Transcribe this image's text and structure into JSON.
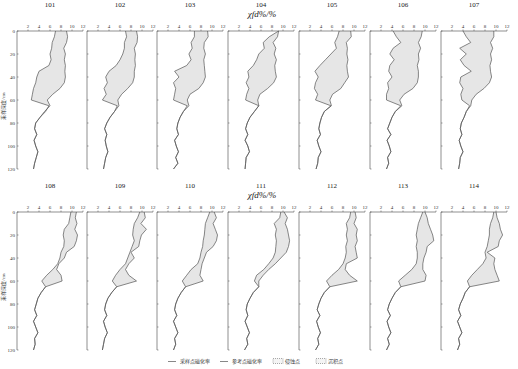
{
  "chart_data": {
    "type": "line",
    "title": "",
    "xlabel": "χfd%/%",
    "ylabel": "采样深度/cm",
    "xlim": [
      0,
      12
    ],
    "ylim": [
      0,
      120
    ],
    "y_inverted": true,
    "x_ticks": [
      2,
      4,
      6,
      8,
      10,
      12
    ],
    "y_ticks": [
      0,
      20,
      40,
      60,
      80,
      100,
      120
    ],
    "grid": false,
    "legend_position": "bottom",
    "legend": [
      {
        "key": "sample",
        "label": "采样点磁化率",
        "style": "solid-line"
      },
      {
        "key": "reference",
        "label": "参考点磁化率",
        "style": "solid-line"
      },
      {
        "key": "erosion",
        "label": "侵蚀点",
        "style": "dashed-box"
      },
      {
        "key": "deposition",
        "label": "沉积点",
        "style": "dashed-box"
      }
    ],
    "depth": [
      0,
      5,
      10,
      15,
      20,
      25,
      30,
      35,
      40,
      45,
      50,
      55,
      60,
      65,
      70,
      75,
      80,
      85,
      90,
      95,
      100,
      105,
      110,
      115,
      120
    ],
    "panels": [
      {
        "id": "101",
        "row": 0,
        "type": "erosion",
        "reference": [
          9.0,
          9.2,
          9.0,
          8.5,
          8.8,
          8.6,
          8.8,
          8.7,
          8.8,
          8.6,
          7.8,
          6.5,
          5.5,
          6.0,
          5.0,
          4.2,
          3.4,
          3.2,
          3.6,
          3.1,
          3.4,
          3.8,
          3.5,
          3.2,
          3.0
        ],
        "sample": [
          7.0,
          6.8,
          6.4,
          6.3,
          6.0,
          6.2,
          5.8,
          4.0,
          3.6,
          3.4,
          3.0,
          2.8,
          2.6,
          5.8,
          5.2,
          4.2,
          3.4,
          3.2,
          3.6,
          3.1,
          3.4,
          3.8,
          3.5,
          3.2,
          3.0
        ]
      },
      {
        "id": "102",
        "row": 0,
        "type": "erosion",
        "reference": [
          9.0,
          9.2,
          9.1,
          8.6,
          8.8,
          8.7,
          8.8,
          8.6,
          8.6,
          8.3,
          7.4,
          6.3,
          5.6,
          5.8,
          5.0,
          4.2,
          3.6,
          3.2,
          3.6,
          3.3,
          3.5,
          3.8,
          3.4,
          3.2,
          3.0
        ],
        "sample": [
          7.0,
          7.2,
          6.8,
          6.8,
          6.5,
          6.0,
          5.3,
          4.0,
          3.4,
          3.7,
          3.1,
          3.5,
          2.8,
          5.5,
          5.0,
          4.2,
          3.6,
          3.2,
          3.6,
          3.3,
          3.5,
          3.8,
          3.4,
          3.2,
          3.0
        ]
      },
      {
        "id": "103",
        "row": 0,
        "type": "erosion",
        "reference": [
          9.2,
          9.3,
          8.6,
          8.5,
          8.8,
          8.5,
          8.6,
          8.7,
          8.8,
          8.4,
          7.6,
          6.0,
          5.5,
          5.8,
          4.8,
          4.2,
          3.8,
          3.6,
          3.9,
          3.2,
          3.5,
          3.9,
          3.4,
          3.8,
          3.0
        ],
        "sample": [
          6.8,
          6.8,
          6.2,
          6.4,
          5.8,
          6.2,
          5.4,
          3.2,
          4.0,
          3.0,
          3.4,
          3.2,
          3.0,
          5.5,
          4.8,
          4.2,
          3.8,
          3.6,
          3.9,
          3.2,
          3.5,
          3.9,
          3.4,
          3.8,
          3.0
        ]
      },
      {
        "id": "104",
        "row": 0,
        "type": "erosion",
        "reference": [
          9.2,
          9.0,
          8.2,
          8.7,
          8.4,
          8.8,
          8.5,
          8.6,
          8.8,
          8.3,
          7.2,
          5.8,
          5.4,
          5.6,
          4.8,
          4.0,
          3.5,
          3.2,
          3.6,
          3.1,
          3.6,
          3.9,
          3.3,
          3.2,
          3.1
        ],
        "sample": [
          9.2,
          7.5,
          6.4,
          6.6,
          5.6,
          5.2,
          4.6,
          3.6,
          3.8,
          3.3,
          3.8,
          3.4,
          3.2,
          5.6,
          4.8,
          4.0,
          3.5,
          3.2,
          3.6,
          3.1,
          3.6,
          3.9,
          3.3,
          3.2,
          3.1
        ]
      },
      {
        "id": "105",
        "row": 0,
        "type": "erosion",
        "reference": [
          9.4,
          9.5,
          8.6,
          8.8,
          8.7,
          8.9,
          8.7,
          8.8,
          9.0,
          8.3,
          7.6,
          6.1,
          5.6,
          5.9,
          4.6,
          4.1,
          3.8,
          3.6,
          3.9,
          3.3,
          3.6,
          4.0,
          3.5,
          3.4,
          3.1
        ],
        "sample": [
          7.3,
          7.0,
          6.5,
          6.8,
          5.8,
          4.8,
          3.8,
          2.9,
          3.5,
          3.0,
          2.8,
          3.4,
          3.0,
          5.8,
          4.6,
          4.1,
          3.8,
          3.6,
          3.9,
          3.3,
          3.6,
          4.0,
          3.5,
          3.4,
          3.1
        ]
      },
      {
        "id": "106",
        "row": 0,
        "type": "erosion",
        "reference": [
          9.5,
          9.3,
          8.8,
          9.2,
          8.8,
          8.9,
          8.6,
          8.8,
          8.8,
          8.6,
          7.8,
          6.2,
          5.4,
          5.8,
          4.6,
          4.0,
          3.6,
          3.2,
          3.8,
          3.1,
          3.5,
          3.8,
          3.2,
          3.4,
          3.0
        ],
        "sample": [
          4.2,
          4.8,
          5.6,
          4.2,
          3.6,
          4.4,
          3.6,
          3.4,
          4.0,
          3.2,
          3.4,
          3.0,
          3.0,
          5.6,
          4.6,
          4.0,
          3.6,
          3.2,
          3.8,
          3.1,
          3.5,
          3.8,
          3.2,
          3.4,
          3.0
        ]
      },
      {
        "id": "107",
        "row": 0,
        "type": "erosion",
        "reference": [
          9.6,
          9.6,
          9.0,
          9.4,
          9.0,
          9.2,
          8.9,
          9.0,
          9.2,
          8.8,
          7.8,
          6.4,
          5.6,
          5.4,
          4.6,
          4.2,
          3.7,
          3.5,
          3.8,
          3.3,
          3.6,
          4.0,
          3.5,
          3.4,
          3.2
        ],
        "sample": [
          4.0,
          4.6,
          5.4,
          3.4,
          4.6,
          3.5,
          4.2,
          5.5,
          3.6,
          3.4,
          4.0,
          3.6,
          3.8,
          5.2,
          4.6,
          4.2,
          3.7,
          3.5,
          3.8,
          3.3,
          3.6,
          4.0,
          3.5,
          3.4,
          3.2
        ]
      },
      {
        "id": "108",
        "row": 1,
        "type": "deposition",
        "reference": [
          9.8,
          9.6,
          9.4,
          8.6,
          8.4,
          8.6,
          8.5,
          8.0,
          7.8,
          7.4,
          6.5,
          5.4,
          4.5,
          5.2,
          4.4,
          3.8,
          3.5,
          3.2,
          3.6,
          3.0,
          3.4,
          3.8,
          3.2,
          3.3,
          3.0
        ],
        "sample": [
          10.8,
          10.6,
          10.9,
          10.5,
          11.0,
          10.8,
          10.4,
          9.0,
          8.6,
          7.6,
          7.2,
          8.0,
          8.2,
          5.2,
          4.4,
          3.8,
          3.5,
          3.2,
          3.6,
          3.0,
          3.4,
          3.8,
          3.2,
          3.3,
          3.0
        ]
      },
      {
        "id": "109",
        "row": 1,
        "type": "deposition",
        "reference": [
          9.6,
          9.2,
          8.6,
          8.4,
          8.3,
          8.6,
          8.2,
          7.8,
          7.4,
          7.0,
          6.0,
          5.2,
          4.6,
          5.4,
          4.5,
          3.8,
          3.4,
          3.2,
          3.6,
          3.0,
          3.3,
          3.7,
          3.2,
          3.0,
          2.8
        ],
        "sample": [
          10.4,
          10.6,
          9.8,
          10.8,
          9.9,
          9.6,
          9.4,
          8.0,
          8.6,
          7.6,
          7.0,
          7.6,
          9.0,
          5.4,
          4.5,
          3.8,
          3.4,
          3.2,
          3.6,
          3.0,
          3.3,
          3.7,
          3.2,
          3.0,
          2.8
        ]
      },
      {
        "id": "110",
        "row": 1,
        "type": "deposition",
        "reference": [
          9.6,
          9.2,
          8.8,
          8.7,
          8.6,
          8.4,
          8.3,
          8.0,
          7.8,
          7.4,
          6.2,
          5.4,
          4.6,
          5.2,
          4.4,
          3.8,
          3.4,
          3.2,
          3.6,
          3.0,
          3.4,
          3.8,
          3.2,
          3.4,
          3.0
        ],
        "sample": [
          10.4,
          10.8,
          10.2,
          10.6,
          11.0,
          10.8,
          10.2,
          9.0,
          8.6,
          8.2,
          8.0,
          7.8,
          8.4,
          5.2,
          4.4,
          3.8,
          3.4,
          3.2,
          3.6,
          3.0,
          3.4,
          3.8,
          3.2,
          3.4,
          3.0
        ]
      },
      {
        "id": "111",
        "row": 1,
        "type": "deposition",
        "reference": [
          9.6,
          9.4,
          8.4,
          8.8,
          8.6,
          8.8,
          8.7,
          8.6,
          8.2,
          7.4,
          6.5,
          5.2,
          4.8,
          5.6,
          4.6,
          4.0,
          3.5,
          3.3,
          3.6,
          3.1,
          3.5,
          3.9,
          3.4,
          3.6,
          3.0
        ],
        "sample": [
          10.2,
          10.8,
          10.4,
          10.8,
          11.0,
          11.2,
          11.0,
          10.6,
          9.6,
          8.6,
          7.4,
          6.4,
          5.6,
          5.6,
          4.6,
          4.0,
          3.5,
          3.3,
          3.6,
          3.1,
          3.5,
          3.9,
          3.4,
          3.6,
          3.0
        ]
      },
      {
        "id": "112",
        "row": 1,
        "type": "deposition",
        "reference": [
          9.4,
          9.2,
          8.6,
          8.8,
          8.6,
          8.8,
          8.5,
          8.6,
          8.4,
          8.0,
          7.2,
          6.0,
          5.0,
          5.6,
          4.6,
          4.0,
          3.6,
          3.3,
          3.8,
          3.2,
          3.5,
          3.9,
          3.4,
          3.6,
          3.0
        ],
        "sample": [
          10.2,
          10.4,
          10.0,
          10.6,
          10.4,
          10.6,
          10.2,
          10.4,
          10.6,
          8.6,
          8.4,
          9.2,
          10.6,
          5.6,
          4.6,
          4.0,
          3.6,
          3.3,
          3.8,
          3.2,
          3.5,
          3.9,
          3.4,
          3.6,
          3.0
        ]
      },
      {
        "id": "113",
        "row": 1,
        "type": "deposition",
        "reference": [
          9.6,
          9.2,
          8.8,
          8.6,
          8.4,
          8.6,
          8.4,
          8.6,
          8.6,
          8.4,
          7.6,
          6.4,
          5.2,
          5.6,
          4.6,
          4.0,
          3.5,
          3.2,
          3.7,
          3.1,
          3.4,
          3.8,
          3.2,
          3.5,
          3.0
        ],
        "sample": [
          10.0,
          10.4,
          10.6,
          11.0,
          11.4,
          11.6,
          10.4,
          10.2,
          9.8,
          9.6,
          9.6,
          10.2,
          10.0,
          5.6,
          4.6,
          4.0,
          3.5,
          3.2,
          3.7,
          3.1,
          3.4,
          3.8,
          3.2,
          3.5,
          3.0
        ]
      },
      {
        "id": "114",
        "row": 1,
        "type": "deposition",
        "reference": [
          9.6,
          9.4,
          9.0,
          8.8,
          8.8,
          8.6,
          8.4,
          8.0,
          8.2,
          7.6,
          6.6,
          5.6,
          4.8,
          5.2,
          4.4,
          4.0,
          3.5,
          3.2,
          3.6,
          3.0,
          3.4,
          3.8,
          3.2,
          3.4,
          3.0
        ],
        "sample": [
          10.0,
          10.2,
          10.6,
          10.8,
          11.2,
          10.6,
          10.4,
          8.4,
          9.8,
          9.6,
          9.8,
          10.2,
          10.6,
          5.2,
          4.4,
          4.0,
          3.5,
          3.2,
          3.6,
          3.0,
          3.4,
          3.8,
          3.2,
          3.4,
          3.0
        ]
      }
    ]
  },
  "figure": {
    "xlabel_top": "χfd%/%",
    "xlabel_bottom": "χfd%/%",
    "ylabel_top": "采样深度/cm",
    "ylabel_bottom": "采样深度/cm"
  },
  "colors": {
    "line": "#555555",
    "axis": "#444444",
    "fill": "#e6e6e6",
    "background": "#ffffff"
  }
}
